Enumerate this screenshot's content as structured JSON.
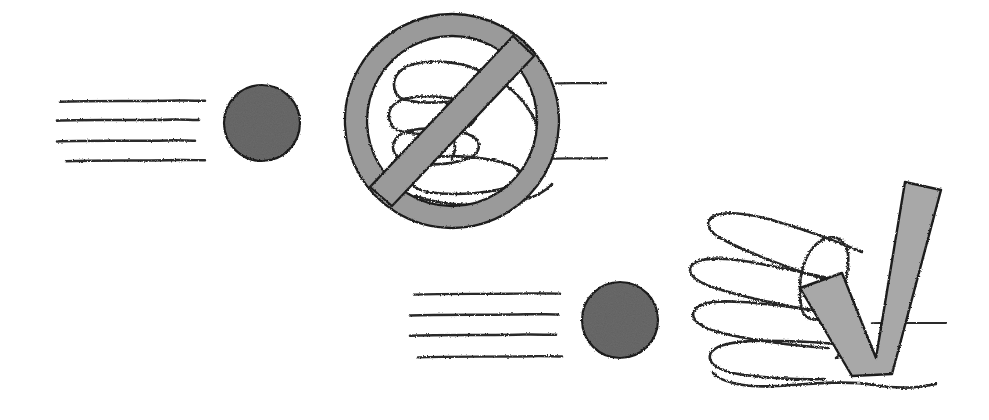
{
  "image": {
    "title": "Hand-drawn instruction illustration: no fist versus open hand with check mark",
    "background_color": "#ffffff",
    "width": 989,
    "height": 420
  },
  "palette": {
    "ink": "#2b2b2b",
    "dark_ink": "#1c1c1c",
    "circle_gray": "#6b6b6b",
    "symbol_gray": "#9a9a9a",
    "symbol_gray_light": "#a8a8a8",
    "paper": "#ffffff"
  },
  "panels": [
    {
      "id": "upper-panel",
      "name": "prohibited-gesture-panel",
      "meaning": "do-not",
      "speed_lines": {
        "name": "upper-speed-lines",
        "count": 4,
        "x_start": 58,
        "x_end": 205,
        "rows_y": [
          101,
          120,
          141,
          160
        ]
      },
      "dot": {
        "name": "upper-dot",
        "cx": 262,
        "cy": 123,
        "r": 38,
        "fill": "#6b6b6b"
      },
      "symbol": {
        "name": "prohibition-sign",
        "type": "no-entry-circle-slash",
        "cx": 452,
        "cy": 121,
        "outer_r": 107,
        "band_thickness": 22,
        "fill": "#9a9a9a",
        "contains": "closed-fist-hand"
      },
      "trailing_lines": {
        "name": "upper-trailing-lines",
        "count": 2,
        "x_start": 560,
        "x_end": 605,
        "rows_y": [
          83,
          158
        ]
      }
    },
    {
      "id": "lower-panel",
      "name": "approved-gesture-panel",
      "meaning": "do-this",
      "speed_lines": {
        "name": "lower-speed-lines",
        "count": 4,
        "x_start": 410,
        "x_end": 560,
        "rows_y": [
          294,
          315,
          335,
          357
        ]
      },
      "dot": {
        "name": "lower-dot",
        "cx": 620,
        "cy": 320,
        "r": 38,
        "fill": "#6b6b6b"
      },
      "symbol": {
        "name": "check-mark",
        "type": "check-mark-v",
        "fill": "#a8a8a8",
        "tip_x": 905,
        "tip_y": 182,
        "overlaps": "open-hand"
      },
      "hand": {
        "name": "open-hand",
        "finger_count": 4,
        "orientation": "fingers-pointing-left"
      },
      "trailing_lines": {
        "name": "lower-trailing-lines",
        "count": 1,
        "x_start": 872,
        "x_end": 945,
        "rows_y": [
          323
        ]
      }
    }
  ]
}
